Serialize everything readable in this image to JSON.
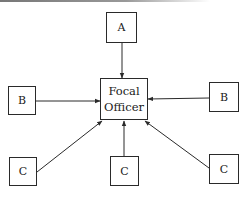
{
  "diagram": {
    "type": "hub-and-spoke",
    "center": {
      "id": "focal",
      "label_line1": "Focal",
      "label_line2": "Officer"
    },
    "nodes": [
      {
        "id": "a",
        "label": "A",
        "position": "top"
      },
      {
        "id": "b1",
        "label": "B",
        "position": "left"
      },
      {
        "id": "b2",
        "label": "B",
        "position": "right"
      },
      {
        "id": "c1",
        "label": "C",
        "position": "bottom-left"
      },
      {
        "id": "c2",
        "label": "C",
        "position": "bottom-center"
      },
      {
        "id": "c3",
        "label": "C",
        "position": "bottom-right"
      }
    ],
    "edges": [
      {
        "from": "a",
        "to": "focal",
        "arrow": "to-focal"
      },
      {
        "from": "b1",
        "to": "focal",
        "arrow": "to-focal"
      },
      {
        "from": "b2",
        "to": "focal",
        "arrow": "to-focal"
      },
      {
        "from": "c1",
        "to": "focal",
        "arrow": "to-focal"
      },
      {
        "from": "c2",
        "to": "focal",
        "arrow": "to-focal"
      },
      {
        "from": "c3",
        "to": "focal",
        "arrow": "to-focal"
      }
    ],
    "colors": {
      "line": "#2a2a2a",
      "background": "#ffffff"
    }
  }
}
